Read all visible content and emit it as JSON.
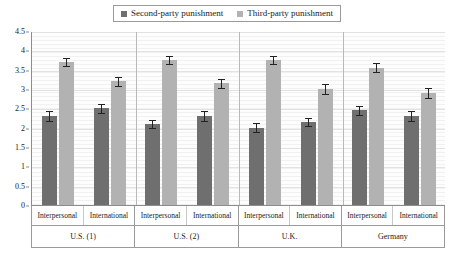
{
  "chart_data": {
    "type": "bar",
    "title": "",
    "xlabel": "",
    "ylabel": "",
    "ylim": [
      0,
      4.5
    ],
    "ytick_values": [
      0,
      0.5,
      1,
      1.5,
      2,
      2.5,
      3,
      3.5,
      4,
      4.5
    ],
    "ytick_labels": [
      "0",
      "0.5",
      "1",
      "1.5",
      "2",
      "2.5",
      "3",
      "3.5",
      "4",
      "4.5"
    ],
    "grid": true,
    "legend_position": "top-center",
    "legend": [
      {
        "name": "Second-party punishment",
        "color": "#6f6f6f"
      },
      {
        "name": "Third-party punishment",
        "color": "#b2b2b2"
      }
    ],
    "groups": [
      {
        "label": "U.S. (1)",
        "subgroups": [
          {
            "label": "Interpersonal",
            "bars": [
              {
                "series": "Second-party punishment",
                "value": 2.3,
                "error": 0.13
              },
              {
                "series": "Third-party punishment",
                "value": 3.7,
                "error": 0.11
              }
            ]
          },
          {
            "label": "International",
            "bars": [
              {
                "series": "Second-party punishment",
                "value": 2.5,
                "error": 0.12
              },
              {
                "series": "Third-party punishment",
                "value": 3.2,
                "error": 0.12
              }
            ]
          }
        ]
      },
      {
        "label": "U.S. (2)",
        "subgroups": [
          {
            "label": "Interpersonal",
            "bars": [
              {
                "series": "Second-party punishment",
                "value": 2.1,
                "error": 0.11
              },
              {
                "series": "Third-party punishment",
                "value": 3.75,
                "error": 0.11
              }
            ]
          },
          {
            "label": "International",
            "bars": [
              {
                "series": "Second-party punishment",
                "value": 2.3,
                "error": 0.14
              },
              {
                "series": "Third-party punishment",
                "value": 3.15,
                "error": 0.12
              }
            ]
          }
        ]
      },
      {
        "label": "U.K.",
        "subgroups": [
          {
            "label": "Interpersonal",
            "bars": [
              {
                "series": "Second-party punishment",
                "value": 2.0,
                "error": 0.11
              },
              {
                "series": "Third-party punishment",
                "value": 3.75,
                "error": 0.11
              }
            ]
          },
          {
            "label": "International",
            "bars": [
              {
                "series": "Second-party punishment",
                "value": 2.15,
                "error": 0.11
              },
              {
                "series": "Third-party punishment",
                "value": 3.0,
                "error": 0.12
              }
            ]
          }
        ]
      },
      {
        "label": "Germany",
        "subgroups": [
          {
            "label": "Interpersonal",
            "bars": [
              {
                "series": "Second-party punishment",
                "value": 2.45,
                "error": 0.11
              },
              {
                "series": "Third-party punishment",
                "value": 3.55,
                "error": 0.11
              }
            ]
          },
          {
            "label": "International",
            "bars": [
              {
                "series": "Second-party punishment",
                "value": 2.3,
                "error": 0.14
              },
              {
                "series": "Third-party punishment",
                "value": 2.9,
                "error": 0.12
              }
            ]
          }
        ]
      }
    ]
  }
}
